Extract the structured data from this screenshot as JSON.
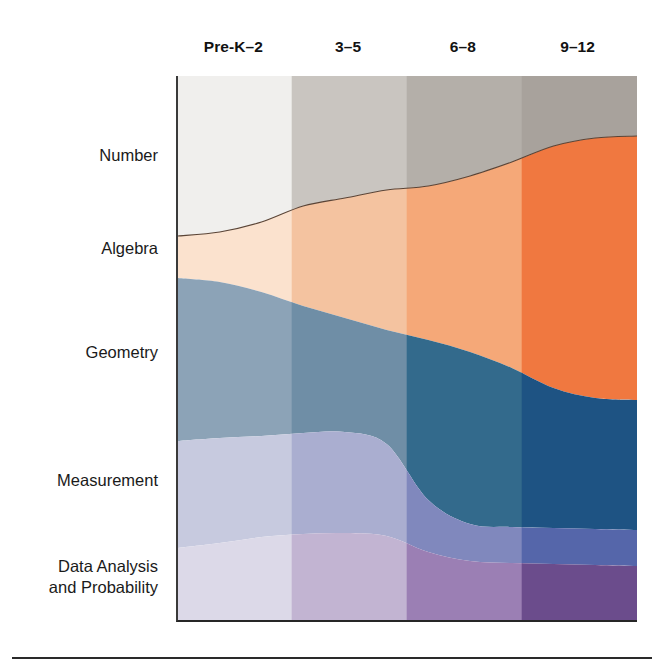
{
  "figure": {
    "title": "",
    "bottom_rule": true
  },
  "columns": [
    {
      "label": "Pre-K–2"
    },
    {
      "label": "3–5"
    },
    {
      "label": "6–8"
    },
    {
      "label": "9–12"
    }
  ],
  "rows": [
    {
      "label": "Number",
      "y": 105
    },
    {
      "label": "Algebra",
      "y": 183
    },
    {
      "label": "Geometry",
      "y": 277
    },
    {
      "label": "Measurement",
      "y": 405
    },
    {
      "label": "Data Analysis",
      "label2": "and Probability",
      "y": 485
    }
  ],
  "colors": {
    "number": [
      "#f0efed",
      "#c9c5c0",
      "#b4afa9",
      "#a8a29c"
    ],
    "algebra": [
      "#fbe2ce",
      "#f4c3a0",
      "#f5a878",
      "#f07840"
    ],
    "geometry": [
      "#8ca3b7",
      "#6f8ea6",
      "#336a8c",
      "#1e5383"
    ],
    "measurement": [
      "#c7cadf",
      "#aaaed0",
      "#8088bd",
      "#5566aa"
    ],
    "data": [
      "#dcd9e8",
      "#c2b4d2",
      "#9b7fb4",
      "#6b4c8c"
    ],
    "outline": "#5a4436",
    "axis": "#2a2a2a",
    "text": "#1a1a1a"
  },
  "chart_data": {
    "type": "area",
    "title": "",
    "xlabel": "",
    "ylabel": "",
    "grid": false,
    "legend_position": "left-row-labels",
    "stacking": "normalized-100",
    "categories": [
      "Pre-K–2",
      "3–5",
      "6–8",
      "9–12"
    ],
    "series": [
      {
        "name": "Number",
        "values": [
          29.5,
          36.0,
          44.5,
          72.0
        ]
      },
      {
        "name": "Algebra",
        "values": [
          7.8,
          15.0,
          20.5,
          18.5
        ]
      },
      {
        "name": "Geometry",
        "values": [
          30.0,
          28.0,
          18.0,
          5.5
        ]
      },
      {
        "name": "Measurement",
        "values": [
          19.5,
          12.5,
          7.5,
          2.0
        ]
      },
      {
        "name": "Data Analysis and Probability",
        "values": [
          13.2,
          8.5,
          9.5,
          2.0
        ]
      }
    ],
    "note": "Stacked band widths shown top-to-bottom; each grade band column is 100% tall.",
    "ylim": [
      0,
      100
    ],
    "boundaries_px": {
      "plot_left": 176,
      "plot_right": 635,
      "plot_top": 76,
      "plot_bottom": 620,
      "column_dividers": [
        290,
        405,
        520
      ],
      "number_bottom": [
        236,
        232,
        222,
        206,
        198,
        190,
        186,
        176,
        162,
        146,
        138,
        136
      ],
      "algebra_bottom": [
        278,
        282,
        292,
        306,
        318,
        330,
        340,
        352,
        368,
        388,
        398,
        400
      ],
      "geometry_bottom": [
        441,
        438,
        436,
        433,
        432,
        444,
        500,
        524,
        527,
        528,
        529,
        530
      ],
      "measurement_bottom": [
        548,
        543,
        537,
        534,
        533,
        536,
        552,
        561,
        563,
        564,
        565,
        566
      ]
    }
  }
}
